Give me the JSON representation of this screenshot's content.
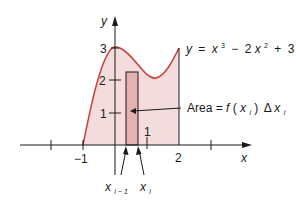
{
  "figure": {
    "equation": {
      "lhs": "y",
      "eq": "=",
      "term1_base": "x",
      "term1_exp": "3",
      "minus": "−",
      "term2_coef": "2",
      "term2_base": "x",
      "term2_exp": "2",
      "plus": "+",
      "const": "3"
    },
    "area_label": {
      "text": "Area = ",
      "f": "f",
      "open": "(",
      "x": "x",
      "sub_i": "i",
      "close": ")",
      "delta": "Δ",
      "x2": "x",
      "sub_i2": "i"
    },
    "axes": {
      "x_label": "x",
      "y_label": "y",
      "y_ticks": [
        "1",
        "2",
        "3"
      ],
      "x_ticks": [
        "−1",
        "1",
        "2"
      ]
    },
    "markers": {
      "x_prev": "x",
      "x_prev_sub": "i − 1",
      "x_curr": "x",
      "x_curr_sub": "i"
    },
    "colors": {
      "curve": "#c8453f",
      "region_fill": "#f3dcdb",
      "rect_fill": "#e4b2b0",
      "axis": "#1a1a1a"
    }
  }
}
